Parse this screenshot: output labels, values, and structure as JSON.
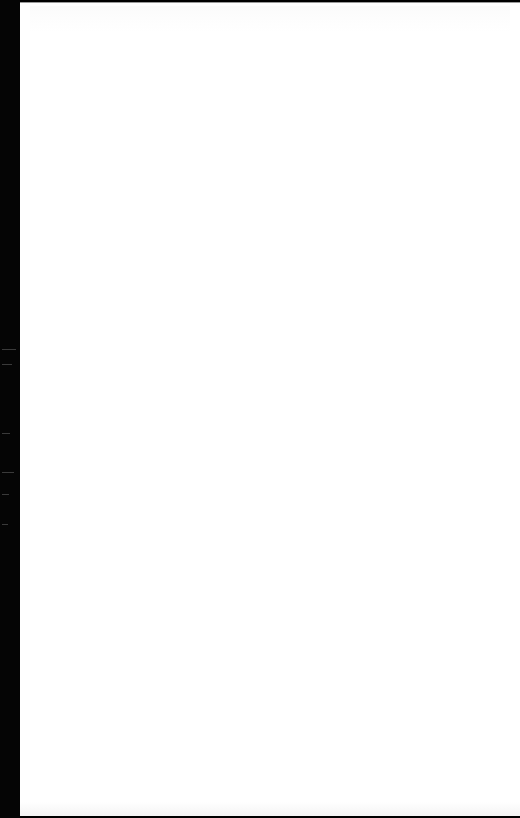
{
  "page": {
    "background": "#ffffff",
    "edge_color": "#050505",
    "content_text": ""
  }
}
